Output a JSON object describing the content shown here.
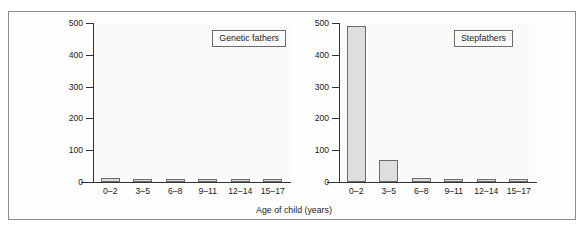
{
  "figure": {
    "x_axis_title": "Age of child (years)",
    "y_axis_title_lines": [
      "Homicide victims per million",
      "co-resident parent-child",
      "dyads per annum"
    ],
    "y_ticks": [
      "0",
      "100",
      "200",
      "300",
      "400",
      "500"
    ],
    "x_ticks": [
      "0–2",
      "3–5",
      "6–8",
      "9–11",
      "12–14",
      "15–17"
    ],
    "panel_left_label": "Genetic fathers",
    "panel_right_label": "Stepfathers",
    "colors": {
      "bar_fill": "#dedede",
      "bar_stroke": "#6b6b6b",
      "axis": "#333333",
      "frame": "#8d8d8d",
      "plot_background": "#fafafa"
    }
  },
  "chart_data": [
    {
      "type": "bar",
      "title": "Genetic fathers",
      "categories": [
        "0–2",
        "3–5",
        "6–8",
        "9–11",
        "12–14",
        "15–17"
      ],
      "values": [
        12,
        8,
        6,
        5,
        5,
        5
      ],
      "xlabel": "Age of child (years)",
      "ylabel": "Homicide victims per million co-resident parent-child dyads per annum",
      "ylim": [
        0,
        500
      ],
      "yticks": [
        0,
        100,
        200,
        300,
        400,
        500
      ],
      "grid": false,
      "legend_position": "top-right"
    },
    {
      "type": "bar",
      "title": "Stepfathers",
      "categories": [
        "0–2",
        "3–5",
        "6–8",
        "9–11",
        "12–14",
        "15–17"
      ],
      "values": [
        492,
        70,
        12,
        7,
        5,
        5
      ],
      "xlabel": "Age of child (years)",
      "ylabel": "Homicide victims per million co-resident parent-child dyads per annum",
      "ylim": [
        0,
        500
      ],
      "yticks": [
        0,
        100,
        200,
        300,
        400,
        500
      ],
      "grid": false,
      "legend_position": "top-right"
    }
  ]
}
